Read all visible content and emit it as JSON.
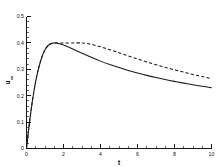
{
  "chart_data": {
    "type": "line",
    "title": "",
    "xlabel": "t",
    "ylabel": "u",
    "ylabel_subscript": "m",
    "xlim": [
      0,
      10
    ],
    "ylim": [
      0,
      0.5
    ],
    "grid": false,
    "legend": false,
    "x_major_ticks": [
      0,
      2,
      4,
      6,
      8,
      10
    ],
    "x_major_tick_labels": [
      "0",
      "2",
      "4",
      "6",
      "8",
      "10"
    ],
    "x_minor_tick_step": 0.5,
    "y_major_ticks": [
      0,
      0.1,
      0.2,
      0.3,
      0.4,
      0.5
    ],
    "y_major_tick_labels": [
      "0",
      "0.1",
      "0.2",
      "0.3",
      "0.4",
      "0.5"
    ],
    "y_minor_tick_step": 0.02,
    "spines": [
      "left",
      "bottom"
    ],
    "series": [
      {
        "name": "solid",
        "style": "solid",
        "color": "#1a1a1a",
        "x": [
          0,
          0.1,
          0.2,
          0.3,
          0.4,
          0.5,
          0.6,
          0.7,
          0.8,
          0.9,
          1.0,
          1.1,
          1.2,
          1.3,
          1.4,
          1.5,
          1.6,
          1.8,
          2.0,
          2.2,
          2.5,
          3.0,
          3.5,
          4.0,
          4.5,
          5.0,
          5.5,
          6.0,
          6.5,
          7.0,
          7.5,
          8.0,
          8.5,
          9.0,
          9.5,
          10.0
        ],
        "values": [
          0.0,
          0.062,
          0.12,
          0.171,
          0.216,
          0.255,
          0.288,
          0.316,
          0.34,
          0.359,
          0.374,
          0.385,
          0.392,
          0.397,
          0.399,
          0.4,
          0.3995,
          0.3965,
          0.392,
          0.3865,
          0.377,
          0.361,
          0.3455,
          0.331,
          0.318,
          0.3065,
          0.2958,
          0.286,
          0.277,
          0.2688,
          0.2612,
          0.2542,
          0.2477,
          0.2416,
          0.2358,
          0.23
        ]
      },
      {
        "name": "dashed",
        "style": "dashed",
        "color": "#1a1a1a",
        "x": [
          0,
          0.1,
          0.2,
          0.3,
          0.4,
          0.5,
          0.6,
          0.7,
          0.8,
          0.9,
          1.0,
          1.2,
          1.4,
          1.6,
          1.8,
          2.0,
          2.5,
          3.0,
          3.2,
          3.5,
          4.0,
          4.5,
          5.0,
          5.5,
          6.0,
          6.5,
          7.0,
          7.5,
          8.0,
          8.5,
          9.0,
          9.5,
          10.0
        ],
        "values": [
          0.0,
          0.062,
          0.12,
          0.171,
          0.216,
          0.255,
          0.288,
          0.316,
          0.34,
          0.359,
          0.374,
          0.392,
          0.399,
          0.4,
          0.4,
          0.4,
          0.4,
          0.4,
          0.3985,
          0.3945,
          0.3855,
          0.3745,
          0.3625,
          0.3505,
          0.339,
          0.328,
          0.3175,
          0.3075,
          0.298,
          0.289,
          0.2805,
          0.2725,
          0.265
        ]
      }
    ]
  }
}
